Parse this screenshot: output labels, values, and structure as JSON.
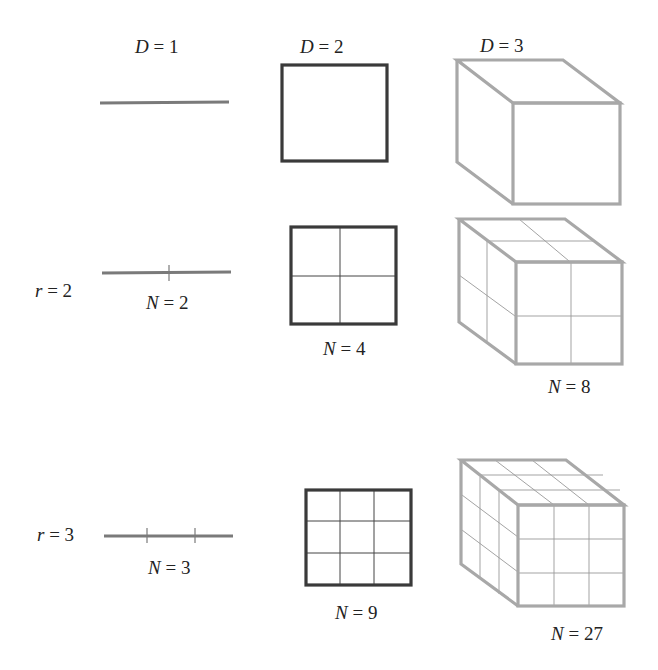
{
  "columns": [
    {
      "var": "D",
      "eq": " = 1"
    },
    {
      "var": "D",
      "eq": " = 2"
    },
    {
      "var": "D",
      "eq": " = 3"
    }
  ],
  "rows": [
    {
      "var": "r",
      "eq": " = 2"
    },
    {
      "var": "r",
      "eq": " = 3"
    }
  ],
  "counts": {
    "r2": [
      {
        "var": "N",
        "eq": " = 2"
      },
      {
        "var": "N",
        "eq": " = 4"
      },
      {
        "var": "N",
        "eq": " = 8"
      }
    ],
    "r3": [
      {
        "var": "N",
        "eq": " = 3"
      },
      {
        "var": "N",
        "eq": " = 9"
      },
      {
        "var": "N",
        "eq": " = 27"
      }
    ]
  },
  "colors": {
    "line": "#7a7a7a",
    "square": "#3a3a3a",
    "cube": "#a8a8a8"
  }
}
